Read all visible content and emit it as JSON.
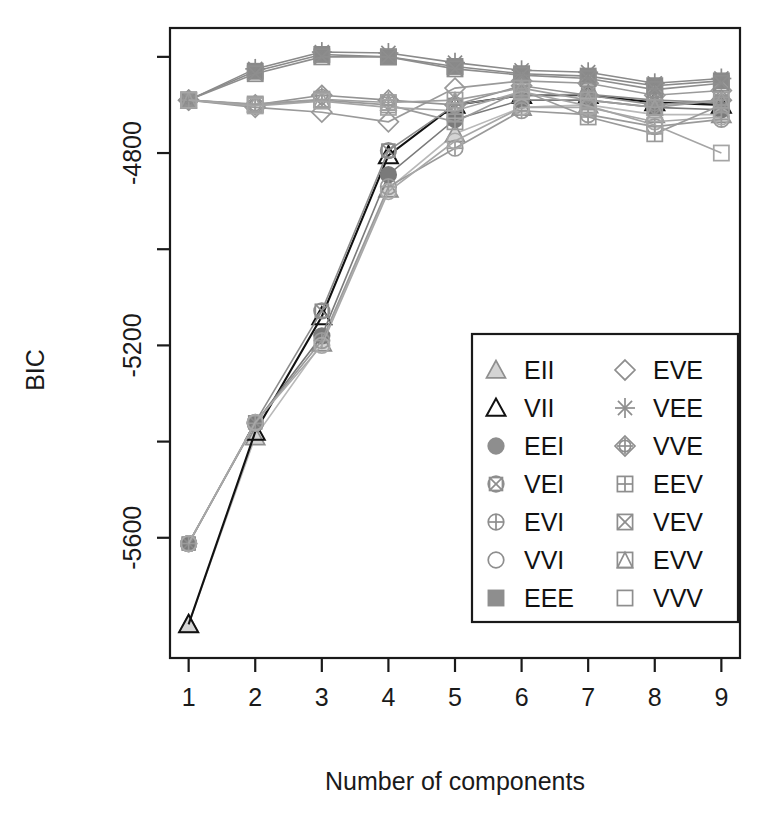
{
  "chart_data": {
    "type": "line",
    "title": "",
    "xlabel": "Number of components",
    "ylabel": "BIC",
    "x": [
      1,
      2,
      3,
      4,
      5,
      6,
      7,
      8,
      9
    ],
    "xticklabels": [
      "1",
      "2",
      "3",
      "4",
      "5",
      "6",
      "7",
      "8",
      "9"
    ],
    "yticks": [
      -4600,
      -4800,
      -5000,
      -5200,
      -5400,
      -5600
    ],
    "yticklabels": [
      "",
      "-4800",
      "",
      "-5200",
      "",
      "-5600"
    ],
    "xlim": [
      0.72,
      9.28
    ],
    "ylim": [
      -5850,
      -4540
    ],
    "grid": false,
    "legend_position": "bottom-right",
    "legend_columns": 2,
    "series": [
      {
        "name": "EII",
        "symbol": "triangle-filled-light",
        "color": "#b9b9b9",
        "values": [
          -5780,
          -5390,
          -5195,
          -4875,
          -4760,
          -4705,
          -4700,
          -4720,
          -4720
        ]
      },
      {
        "name": "VII",
        "symbol": "triangle-open",
        "color": "#111111",
        "values": [
          -5780,
          -5380,
          -5140,
          -4805,
          -4700,
          -4680,
          -4680,
          -4695,
          -4700
        ]
      },
      {
        "name": "EEI",
        "symbol": "circle-filled",
        "color": "#7a7a7a",
        "values": [
          -5612,
          -5362,
          -5180,
          -4845,
          -4730,
          -4690,
          -4690,
          -4705,
          -4710
        ]
      },
      {
        "name": "VEI",
        "symbol": "circle-x-square",
        "color": "#8c8c8c",
        "values": [
          -5612,
          -5360,
          -5128,
          -4795,
          -4700,
          -4680,
          -4678,
          -4690,
          -4695
        ]
      },
      {
        "name": "EVI",
        "symbol": "circle-plus",
        "color": "#9a9a9a",
        "values": [
          -5612,
          -5362,
          -5190,
          -4870,
          -4790,
          -4712,
          -4720,
          -4745,
          -4730
        ]
      },
      {
        "name": "VVI",
        "symbol": "circle-open",
        "color": "#a8a8a8",
        "values": [
          -5612,
          -5360,
          -5200,
          -4880,
          -4775,
          -4705,
          -4705,
          -4735,
          -4725
        ]
      },
      {
        "name": "EEE",
        "symbol": "square-filled",
        "color": "#8a8a8a",
        "values": [
          -4690,
          -4630,
          -4595,
          -4600,
          -4620,
          -4635,
          -4640,
          -4660,
          -4650
        ]
      },
      {
        "name": "EVE",
        "symbol": "diamond-open",
        "color": "#9a9a9a",
        "values": [
          -4690,
          -4705,
          -4715,
          -4735,
          -4665,
          -4650,
          -4655,
          -4680,
          -4670
        ]
      },
      {
        "name": "VEE",
        "symbol": "asterisk",
        "color": "#8a8a8a",
        "values": [
          -4690,
          -4625,
          -4590,
          -4592,
          -4612,
          -4628,
          -4632,
          -4655,
          -4645
        ]
      },
      {
        "name": "VVE",
        "symbol": "diamond-plus",
        "color": "#949494",
        "values": [
          -4690,
          -4700,
          -4680,
          -4690,
          -4700,
          -4660,
          -4680,
          -4700,
          -4690
        ]
      },
      {
        "name": "EEV",
        "symbol": "square-plus",
        "color": "#9a9a9a",
        "values": [
          -4690,
          -4700,
          -4690,
          -4700,
          -4735,
          -4670,
          -4725,
          -4760,
          -4700
        ]
      },
      {
        "name": "VEV",
        "symbol": "square-x",
        "color": "#8e8e8e",
        "values": [
          -4690,
          -4635,
          -4600,
          -4600,
          -4625,
          -4638,
          -4645,
          -4668,
          -4655
        ]
      },
      {
        "name": "EVV",
        "symbol": "square-triangle",
        "color": "#9e9e9e",
        "values": [
          -4690,
          -4698,
          -4688,
          -4695,
          -4690,
          -4665,
          -4690,
          -4705,
          -4690
        ]
      },
      {
        "name": "VVV",
        "symbol": "square-open",
        "color": "#a5a5a5",
        "values": [
          -4690,
          -4702,
          -4692,
          -4705,
          -4712,
          -4672,
          -4702,
          -4742,
          -4800
        ]
      }
    ]
  },
  "legend": {
    "column_left": [
      {
        "label": "EII",
        "symbol": "triangle-filled-light"
      },
      {
        "label": "VII",
        "symbol": "triangle-open"
      },
      {
        "label": "EEI",
        "symbol": "circle-filled"
      },
      {
        "label": "VEI",
        "symbol": "circle-x-square"
      },
      {
        "label": "EVI",
        "symbol": "circle-plus"
      },
      {
        "label": "VVI",
        "symbol": "circle-open"
      },
      {
        "label": "EEE",
        "symbol": "square-filled"
      }
    ],
    "column_right": [
      {
        "label": "EVE",
        "symbol": "diamond-open"
      },
      {
        "label": "VEE",
        "symbol": "asterisk"
      },
      {
        "label": "VVE",
        "symbol": "diamond-plus"
      },
      {
        "label": "EEV",
        "symbol": "square-plus"
      },
      {
        "label": "VEV",
        "symbol": "square-x"
      },
      {
        "label": "EVV",
        "symbol": "square-triangle"
      },
      {
        "label": "VVV",
        "symbol": "square-open"
      }
    ]
  },
  "colors": {
    "axis": "#1a1a1a",
    "background": "#ffffff",
    "dark_series": "#111111",
    "grey_series": "#8e8e8e"
  }
}
